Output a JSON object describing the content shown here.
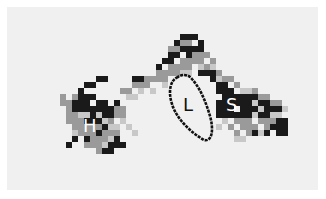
{
  "figure": {
    "background": "#ffffff",
    "panel_color": "#f0f0f0",
    "cell_size": 6,
    "palette": {
      "light": "#c8c8c8",
      "mid": "#9a9a9a",
      "dark": "#1a1a1a"
    },
    "labels": [
      {
        "id": "H",
        "text": "H",
        "x": 83,
        "y": 117,
        "color": "#ffffff"
      },
      {
        "id": "L",
        "text": "L",
        "x": 183,
        "y": 96,
        "color": "#111111"
      },
      {
        "id": "S",
        "text": "S",
        "x": 226,
        "y": 96,
        "color": "#ffffff"
      }
    ],
    "loop_outline": "M178 77 C170 80 168 92 172 104 C176 118 190 132 204 140 C212 142 214 130 210 116 C206 102 200 88 192 79 C188 74 182 74 178 77 Z"
  },
  "cells": {
    "mid": [
      [
        60,
        94
      ],
      [
        60,
        100
      ],
      [
        66,
        100
      ],
      [
        66,
        106
      ],
      [
        72,
        94
      ],
      [
        66,
        112
      ],
      [
        72,
        112
      ],
      [
        78,
        118
      ],
      [
        72,
        118
      ],
      [
        66,
        118
      ],
      [
        72,
        124
      ],
      [
        78,
        124
      ],
      [
        84,
        124
      ],
      [
        90,
        124
      ],
      [
        96,
        124
      ],
      [
        84,
        130
      ],
      [
        90,
        130
      ],
      [
        102,
        130
      ],
      [
        78,
        130
      ],
      [
        90,
        136
      ],
      [
        96,
        136
      ],
      [
        102,
        136
      ],
      [
        96,
        142
      ],
      [
        90,
        142
      ],
      [
        84,
        142
      ],
      [
        96,
        148
      ],
      [
        108,
        118
      ],
      [
        114,
        112
      ],
      [
        120,
        112
      ],
      [
        114,
        106
      ],
      [
        120,
        106
      ],
      [
        108,
        130
      ],
      [
        114,
        130
      ],
      [
        120,
        88
      ],
      [
        126,
        88
      ],
      [
        132,
        82
      ],
      [
        138,
        82
      ],
      [
        144,
        76
      ],
      [
        150,
        76
      ],
      [
        156,
        70
      ],
      [
        162,
        70
      ],
      [
        168,
        64
      ],
      [
        174,
        64
      ],
      [
        180,
        58
      ],
      [
        186,
        58
      ],
      [
        192,
        52
      ],
      [
        198,
        52
      ],
      [
        144,
        82
      ],
      [
        156,
        76
      ],
      [
        162,
        76
      ],
      [
        168,
        70
      ],
      [
        174,
        70
      ],
      [
        180,
        64
      ],
      [
        186,
        64
      ],
      [
        192,
        58
      ],
      [
        198,
        58
      ],
      [
        168,
        46
      ],
      [
        174,
        46
      ],
      [
        180,
        40
      ],
      [
        186,
        40
      ],
      [
        204,
        52
      ],
      [
        210,
        58
      ],
      [
        204,
        64
      ],
      [
        216,
        70
      ],
      [
        222,
        76
      ],
      [
        228,
        76
      ],
      [
        234,
        82
      ],
      [
        252,
        88
      ],
      [
        258,
        94
      ],
      [
        264,
        94
      ],
      [
        270,
        100
      ],
      [
        276,
        100
      ],
      [
        234,
        118
      ],
      [
        240,
        124
      ],
      [
        246,
        124
      ],
      [
        252,
        124
      ],
      [
        258,
        118
      ],
      [
        264,
        118
      ],
      [
        270,
        118
      ],
      [
        246,
        118
      ],
      [
        240,
        118
      ],
      [
        228,
        124
      ],
      [
        234,
        130
      ],
      [
        264,
        124
      ],
      [
        246,
        130
      ]
    ],
    "light": [
      [
        78,
        112
      ],
      [
        84,
        112
      ],
      [
        96,
        112
      ],
      [
        102,
        118
      ],
      [
        108,
        124
      ],
      [
        114,
        124
      ],
      [
        102,
        142
      ],
      [
        108,
        136
      ],
      [
        72,
        130
      ],
      [
        96,
        130
      ],
      [
        120,
        118
      ],
      [
        126,
        124
      ],
      [
        132,
        130
      ],
      [
        126,
        94
      ],
      [
        132,
        94
      ],
      [
        138,
        88
      ],
      [
        150,
        88
      ],
      [
        162,
        82
      ],
      [
        180,
        70
      ],
      [
        186,
        70
      ],
      [
        198,
        64
      ],
      [
        210,
        64
      ],
      [
        216,
        76
      ],
      [
        240,
        88
      ],
      [
        246,
        88
      ],
      [
        252,
        100
      ],
      [
        258,
        106
      ],
      [
        270,
        112
      ],
      [
        276,
        112
      ],
      [
        282,
        106
      ],
      [
        252,
        112
      ],
      [
        222,
        118
      ],
      [
        216,
        124
      ],
      [
        258,
        130
      ],
      [
        234,
        136
      ],
      [
        240,
        136
      ]
    ],
    "dark": [
      [
        78,
        88
      ],
      [
        84,
        82
      ],
      [
        90,
        82
      ],
      [
        96,
        76
      ],
      [
        102,
        76
      ],
      [
        78,
        94
      ],
      [
        72,
        100
      ],
      [
        78,
        100
      ],
      [
        84,
        100
      ],
      [
        72,
        106
      ],
      [
        78,
        106
      ],
      [
        84,
        106
      ],
      [
        90,
        106
      ],
      [
        84,
        94
      ],
      [
        90,
        94
      ],
      [
        96,
        100
      ],
      [
        102,
        100
      ],
      [
        96,
        106
      ],
      [
        102,
        106
      ],
      [
        102,
        112
      ],
      [
        108,
        112
      ],
      [
        90,
        112
      ],
      [
        108,
        106
      ],
      [
        114,
        100
      ],
      [
        96,
        118
      ],
      [
        90,
        118
      ],
      [
        84,
        118
      ],
      [
        96,
        130
      ],
      [
        102,
        124
      ],
      [
        114,
        136
      ],
      [
        114,
        142
      ],
      [
        108,
        142
      ],
      [
        120,
        142
      ],
      [
        84,
        136
      ],
      [
        72,
        136
      ],
      [
        102,
        148
      ],
      [
        108,
        148
      ],
      [
        66,
        142
      ],
      [
        132,
        76
      ],
      [
        138,
        76
      ],
      [
        156,
        64
      ],
      [
        162,
        58
      ],
      [
        168,
        58
      ],
      [
        168,
        52
      ],
      [
        174,
        52
      ],
      [
        180,
        46
      ],
      [
        186,
        46
      ],
      [
        186,
        52
      ],
      [
        192,
        46
      ],
      [
        174,
        40
      ],
      [
        180,
        34
      ],
      [
        186,
        34
      ],
      [
        192,
        34
      ],
      [
        198,
        40
      ],
      [
        198,
        46
      ],
      [
        198,
        70
      ],
      [
        204,
        70
      ],
      [
        210,
        70
      ],
      [
        210,
        76
      ],
      [
        216,
        82
      ],
      [
        216,
        88
      ],
      [
        222,
        82
      ],
      [
        222,
        88
      ],
      [
        222,
        94
      ],
      [
        228,
        88
      ],
      [
        228,
        94
      ],
      [
        234,
        94
      ],
      [
        234,
        100
      ],
      [
        240,
        94
      ],
      [
        240,
        100
      ],
      [
        246,
        100
      ],
      [
        246,
        94
      ],
      [
        252,
        94
      ],
      [
        252,
        106
      ],
      [
        258,
        100
      ],
      [
        264,
        100
      ],
      [
        264,
        106
      ],
      [
        270,
        106
      ],
      [
        276,
        106
      ],
      [
        276,
        118
      ],
      [
        270,
        124
      ],
      [
        276,
        124
      ],
      [
        282,
        118
      ],
      [
        282,
        124
      ],
      [
        282,
        130
      ],
      [
        276,
        130
      ],
      [
        216,
        100
      ],
      [
        216,
        106
      ],
      [
        222,
        100
      ],
      [
        222,
        106
      ],
      [
        228,
        112
      ],
      [
        234,
        112
      ],
      [
        240,
        112
      ],
      [
        240,
        106
      ],
      [
        228,
        106
      ],
      [
        216,
        112
      ],
      [
        222,
        112
      ],
      [
        246,
        106
      ],
      [
        246,
        112
      ],
      [
        258,
        112
      ],
      [
        264,
        112
      ],
      [
        228,
        100
      ],
      [
        252,
        130
      ],
      [
        264,
        130
      ]
    ]
  }
}
